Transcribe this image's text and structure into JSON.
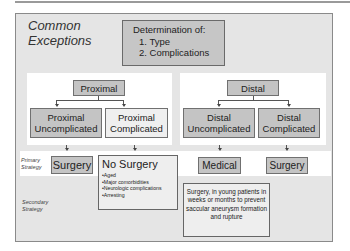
{
  "title": {
    "line1": "Common",
    "line2": "Exceptions"
  },
  "determination": {
    "heading": "Determination of:",
    "items": [
      "1. Type",
      "2. Complications"
    ]
  },
  "proximal": {
    "label": "Proximal",
    "uncomplicated": {
      "line1": "Proximal",
      "line2": "Uncomplicated"
    },
    "complicated": {
      "line1": "Proximal",
      "line2": "Complicated"
    }
  },
  "distal": {
    "label": "Distal",
    "uncomplicated": {
      "line1": "Distal",
      "line2": "Uncomplicated"
    },
    "complicated": {
      "line1": "Distal",
      "line2": "Complicated"
    }
  },
  "strategy_labels": {
    "primary": {
      "line1": "Primary",
      "line2": "Strategy"
    },
    "secondary": {
      "line1": "Secondary",
      "line2": "Strategy"
    }
  },
  "outcomes": {
    "proximal_uncomplicated": "Surgery",
    "proximal_complicated": {
      "heading": "No Surgery",
      "bullets": [
        "Aged",
        "Major comorbidities",
        "Neurologic complications",
        "Arresting"
      ]
    },
    "distal_uncomplicated": "Medical",
    "distal_complicated": "Surgery",
    "secondary_note": "Surgery, in young patients in weeks or months to prevent saccular aneurysm formation and rupture"
  },
  "colors": {
    "background": "#e5e5e5",
    "node_fill": "#c4c4c4",
    "panel": "#ffffff",
    "border": "#707070"
  }
}
